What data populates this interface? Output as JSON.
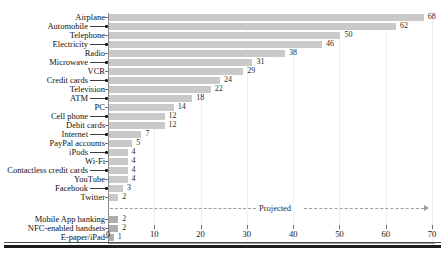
{
  "chart_data": {
    "type": "bar",
    "orientation": "horizontal",
    "title": "",
    "xlabel": "",
    "ylabel": "",
    "xlim": [
      0,
      70
    ],
    "xticks": [
      0,
      10,
      20,
      30,
      40,
      50,
      60,
      70
    ],
    "grid": true,
    "legend": null,
    "annotations": [
      {
        "text": "Projected",
        "after_category": "Twitter"
      }
    ],
    "categories": [
      "Airplane",
      "Automobile",
      "Telephone",
      "Electricity",
      "Radio",
      "Microwave",
      "VCR",
      "Credit cards",
      "Television",
      "ATM",
      "PC",
      "Cell phone",
      "Debit cards",
      "Internet",
      "PayPal accounts",
      "iPods",
      "Wi-Fi",
      "Contactless credit cards",
      "YouTube",
      "Facebook",
      "Twitter",
      "Mobile App banking",
      "NFC-enabled handsets",
      "E-paper/iPad"
    ],
    "values": [
      68,
      62,
      50,
      46,
      38,
      31,
      29,
      24,
      22,
      18,
      14,
      12,
      12,
      7,
      5,
      4,
      4,
      4,
      4,
      3,
      2,
      2,
      2,
      1
    ],
    "projected": [
      false,
      false,
      false,
      false,
      false,
      false,
      false,
      false,
      false,
      false,
      false,
      false,
      false,
      false,
      false,
      false,
      false,
      false,
      false,
      false,
      false,
      true,
      true,
      true
    ],
    "bar_color": "#c9c9c9",
    "projected_bar_color": "#aeaeae"
  },
  "xaxis": {
    "labels": [
      "0",
      "10",
      "20",
      "30",
      "40",
      "50",
      "60",
      "70"
    ]
  },
  "value_labels": [
    "68",
    "62",
    "50",
    "46",
    "38",
    "31",
    "29",
    "24",
    "22",
    "18",
    "14",
    "12",
    "12",
    "7",
    "5",
    "4",
    "4",
    "4",
    "4",
    "3",
    "2",
    "2",
    "2",
    "1"
  ],
  "category_labels": [
    "Airplane",
    "Automobile",
    "Telephone",
    "Electricity",
    "Radio",
    "Microwave",
    "VCR",
    "Credit cards",
    "Television",
    "ATM",
    "PC",
    "Cell phone",
    "Debit cards",
    "Internet",
    "PayPal accounts",
    "iPods",
    "Wi-Fi",
    "Contactless credit cards",
    "YouTube",
    "Facebook",
    "Twitter",
    "Mobile App banking",
    "NFC-enabled handsets",
    "E-paper/iPad"
  ],
  "projected_note": "Projected"
}
